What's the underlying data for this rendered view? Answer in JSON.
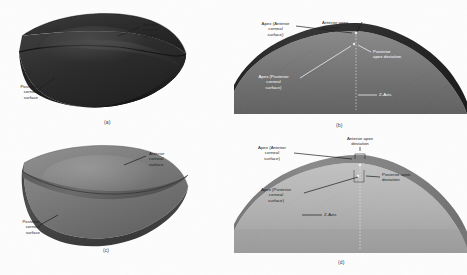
{
  "figure": {
    "type": "scientific-figure",
    "rendering": "grayscale scanned halftone",
    "width": 467,
    "height": 275,
    "background_color": "#fdfdfd"
  },
  "panels": [
    {
      "id": "a",
      "caption": "(a)",
      "kind": "3d-corneal-lens-model",
      "tone": "dark",
      "fill_color": "#262626",
      "labels": [
        {
          "name": "anterior-corneal-surface",
          "text": "Anterior\ncorneal\nsurface"
        },
        {
          "name": "posterior-corneal-surface",
          "text": "Posterior\ncorneal\nsurface"
        }
      ]
    },
    {
      "id": "b",
      "caption": "(b)",
      "kind": "2d-corneal-cross-section",
      "tone": "dark",
      "fill_color": "#3c3c3c",
      "labels": [
        {
          "name": "apex-anterior-corneal-surface",
          "text": "Apex (Anterior\ncorneal\nsurface)"
        },
        {
          "name": "anterior-apex-deviation",
          "text": "Anterior apex\ndeviation"
        },
        {
          "name": "posterior-apex-deviation",
          "text": "Posterior\napex deviation"
        },
        {
          "name": "apex-posterior-corneal-surface",
          "text": "Apex (Posterior\ncorneal\nsurface)"
        },
        {
          "name": "z-axis",
          "text": "Z-Axis"
        }
      ]
    },
    {
      "id": "c",
      "caption": "(c)",
      "kind": "3d-corneal-lens-model",
      "tone": "medium",
      "fill_color": "#6d6d6d",
      "labels": [
        {
          "name": "anterior-corneal-surface",
          "text": "Anterior\ncorneal\nsurface"
        },
        {
          "name": "posterior-corneal-surface",
          "text": "Posterior\ncorneal\nsurface"
        }
      ]
    },
    {
      "id": "d",
      "caption": "(d)",
      "kind": "2d-corneal-cross-section",
      "tone": "light",
      "fill_color": "#a8a8a8",
      "labels": [
        {
          "name": "apex-anterior-corneal-surface",
          "text": "Apex (Anterior\ncorneal\nsurface)"
        },
        {
          "name": "anterior-apex-deviation",
          "text": "Anterior apex\ndeviation"
        },
        {
          "name": "posterior-apex-deviation",
          "text": "Posterior apex\ndeviation"
        },
        {
          "name": "apex-posterior-corneal-surface",
          "text": "Apex (Posterior\ncorneal\nsurface)"
        },
        {
          "name": "z-axis",
          "text": "Z-Axis"
        }
      ]
    }
  ],
  "panel_a": {
    "caption": "(a)",
    "anterior_line1": "Anterior",
    "anterior_line2": "corneal",
    "anterior_line3": "surface",
    "posterior_line1": "Posterior",
    "posterior_line2": "corneal",
    "posterior_line3": "surface"
  },
  "panel_b": {
    "caption": "(b)",
    "apex_ant_line1": "Apex (Anterior",
    "apex_ant_line2": "corneal",
    "apex_ant_line3": "surface)",
    "ant_dev_line1": "Anterior apex",
    "ant_dev_line2": "deviation",
    "post_dev_line1": "Posterior",
    "post_dev_line2": "apex deviation",
    "apex_post_line1": "Apex (Posterior",
    "apex_post_line2": "corneal",
    "apex_post_line3": "surface)",
    "z_axis": "Z-Axis"
  },
  "panel_c": {
    "caption": "(c)",
    "anterior_line1": "Anterior",
    "anterior_line2": "corneal",
    "anterior_line3": "surface",
    "posterior_line1": "Posterior",
    "posterior_line2": "corneal",
    "posterior_line3": "surface"
  },
  "panel_d": {
    "caption": "(d)",
    "apex_ant_line1": "Apex (Anterior",
    "apex_ant_line2": "corneal",
    "apex_ant_line3": "surface)",
    "ant_dev_line1": "Anterior apex",
    "ant_dev_line2": "deviation",
    "post_dev_line1": "Posterior apex",
    "post_dev_line2": "deviation",
    "apex_post_line1": "Apex (Posterior",
    "apex_post_line2": "corneal",
    "apex_post_line3": "surface)",
    "z_axis": "Z-Axis"
  },
  "colors": {
    "panel_a_body": "#262626",
    "panel_a_edge": "#141414",
    "panel_a_top": "#343434",
    "panel_b_anterior_band": "#2e2e2e",
    "panel_b_stroma": "#747474",
    "panel_c_top": "#7b7b7b",
    "panel_c_side": "#4a4a4a",
    "panel_c_edge": "#5c5c5c",
    "panel_d_anterior_band": "#7e7e7e",
    "panel_d_stroma": "#b4b4b4",
    "leader_line": "#1b1b1b",
    "leader_line_light": "#ffffff",
    "background": "#fdfdfd"
  }
}
